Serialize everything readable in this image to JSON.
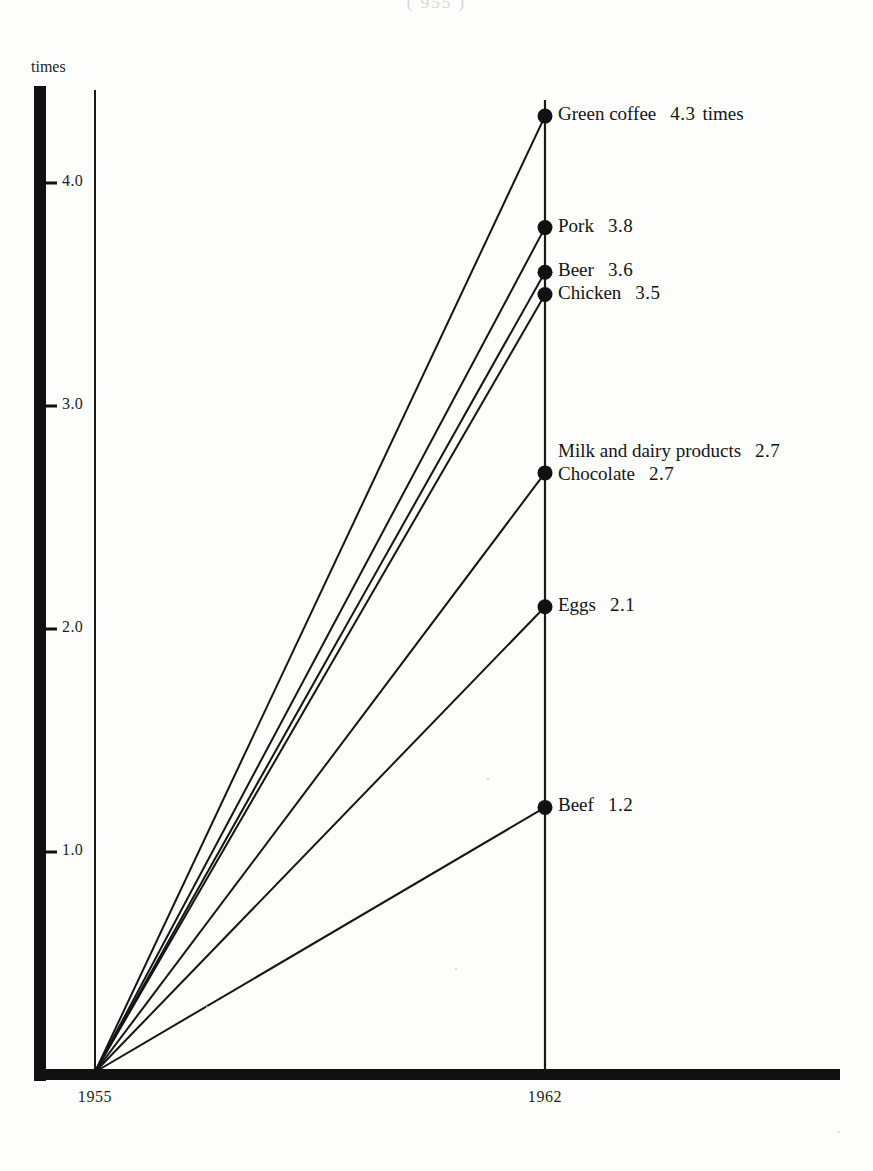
{
  "running_head": "( 955 )",
  "axis": {
    "y_unit_label": "times",
    "y_ticks": [
      {
        "value": 4.0,
        "label": "4.0"
      },
      {
        "value": 3.0,
        "label": "3.0"
      },
      {
        "value": 2.0,
        "label": "2.0"
      },
      {
        "value": 1.0,
        "label": "1.0"
      }
    ],
    "x_ticks": [
      {
        "value": 1955,
        "label": "1955"
      },
      {
        "value": 1962,
        "label": "1962"
      }
    ]
  },
  "chart_data": {
    "type": "line",
    "title": "",
    "subtitle": "",
    "xlabel": "",
    "ylabel": "times",
    "x": [
      1955,
      1962
    ],
    "xlim": [
      1955,
      1962
    ],
    "ylim": [
      0,
      4.6
    ],
    "grid": false,
    "legend_position": "right-inline-endpoint-labels",
    "series": [
      {
        "name": "Green coffee",
        "values": [
          0,
          4.3
        ],
        "endpoint": 4.3,
        "value_label": "4.3",
        "unit_label": "times"
      },
      {
        "name": "Pork",
        "values": [
          0,
          3.8
        ],
        "endpoint": 3.8,
        "value_label": "3.8",
        "unit_label": ""
      },
      {
        "name": "Beer",
        "values": [
          0,
          3.6
        ],
        "endpoint": 3.6,
        "value_label": "3.6",
        "unit_label": ""
      },
      {
        "name": "Chicken",
        "values": [
          0,
          3.5
        ],
        "endpoint": 3.5,
        "value_label": "3.5",
        "unit_label": ""
      },
      {
        "name": "Milk and dairy products",
        "values": [
          0,
          2.7
        ],
        "endpoint": 2.7,
        "value_label": "2.7",
        "unit_label": ""
      },
      {
        "name": "Chocolate",
        "values": [
          0,
          2.7
        ],
        "endpoint": 2.7,
        "value_label": "2.7",
        "unit_label": ""
      },
      {
        "name": "Eggs",
        "values": [
          0,
          2.1
        ],
        "endpoint": 2.1,
        "value_label": "2.1",
        "unit_label": ""
      },
      {
        "name": "Beef",
        "values": [
          0,
          1.2
        ],
        "endpoint": 1.2,
        "value_label": "1.2",
        "unit_label": ""
      }
    ]
  },
  "colors": {
    "ink": "#141414",
    "paper": "#fdfdfc",
    "axis": "#111111"
  }
}
